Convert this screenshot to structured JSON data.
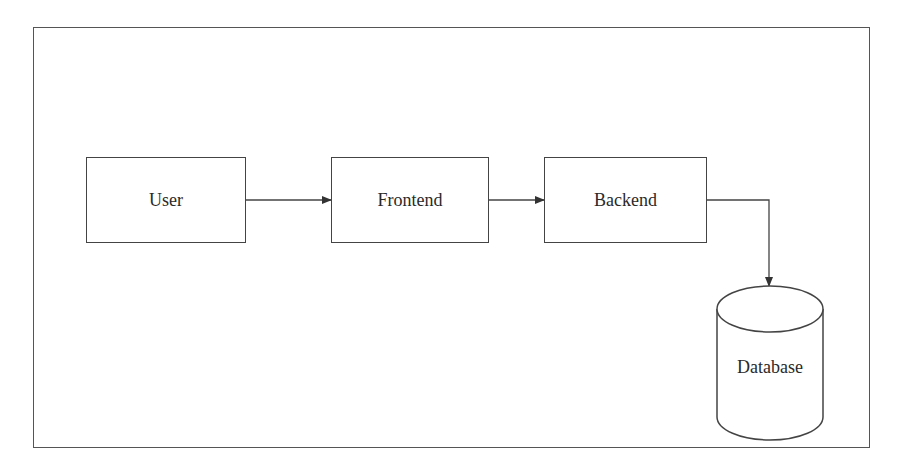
{
  "diagram": {
    "type": "architecture-flow",
    "nodes": [
      {
        "id": "user",
        "label": "User",
        "shape": "rectangle"
      },
      {
        "id": "frontend",
        "label": "Frontend",
        "shape": "rectangle"
      },
      {
        "id": "backend",
        "label": "Backend",
        "shape": "rectangle"
      },
      {
        "id": "database",
        "label": "Database",
        "shape": "cylinder"
      }
    ],
    "edges": [
      {
        "from": "user",
        "to": "frontend"
      },
      {
        "from": "frontend",
        "to": "backend"
      },
      {
        "from": "backend",
        "to": "database"
      }
    ],
    "colors": {
      "stroke": "#444444",
      "text": "#2a2a2a",
      "background": "#ffffff"
    }
  }
}
